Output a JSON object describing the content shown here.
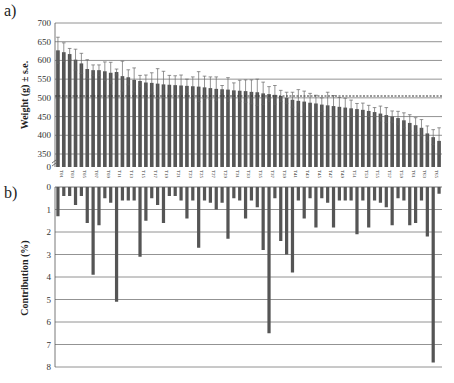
{
  "chart_data": [
    {
      "panel": "a)",
      "type": "bar",
      "title": "",
      "xlabel": "",
      "ylabel": "Weight (g) ± s.e.",
      "ylim": [
        350,
        700
      ],
      "yticks": [
        "700",
        "650",
        "600",
        "550",
        "500",
        "450",
        "400",
        "350",
        "0"
      ],
      "axis_break": true,
      "grid": true,
      "reference_line": {
        "value": 505,
        "style": "dashed"
      },
      "categories": [
        "T01",
        "T02",
        "T03",
        "T04",
        "T05",
        "T06",
        "T07",
        "T08",
        "T09",
        "T10",
        "T11",
        "T12",
        "T13",
        "T14",
        "T15",
        "T16",
        "T17",
        "T18",
        "T19",
        "T20",
        "T21",
        "T22",
        "T23",
        "T24",
        "T25",
        "T26",
        "T27",
        "T28",
        "T29",
        "T30",
        "T31",
        "T32",
        "T33",
        "T34",
        "T35",
        "T36",
        "T37",
        "T38",
        "T39",
        "T40",
        "T41",
        "T42",
        "T43",
        "T44",
        "T45",
        "T46",
        "T47",
        "T48",
        "T49",
        "T50",
        "T51",
        "T52",
        "T53",
        "T54",
        "T55",
        "T56",
        "T57",
        "T58",
        "T59",
        "T60",
        "T61",
        "T62",
        "T63",
        "T64",
        "T65",
        "T66"
      ],
      "xtick_labels": [
        "T01",
        "T03",
        "T05",
        "T07",
        "T09",
        "T11",
        "T13",
        "T15",
        "T17",
        "T19",
        "T21",
        "T23",
        "T25",
        "T27",
        "T29",
        "T31",
        "T33",
        "T35",
        "T37",
        "T39",
        "T41",
        "T43",
        "T45",
        "T47",
        "T49",
        "T51",
        "T53",
        "T55",
        "T57",
        "T59",
        "T61",
        "T63",
        "T65"
      ],
      "values": [
        627,
        622,
        617,
        602,
        592,
        577,
        574,
        574,
        571,
        567,
        569,
        558,
        555,
        548,
        545,
        541,
        540,
        538,
        536,
        535,
        534,
        533,
        532,
        531,
        530,
        528,
        526,
        524,
        523,
        522,
        520,
        519,
        518,
        516,
        515,
        512,
        510,
        508,
        505,
        500,
        495,
        492,
        490,
        487,
        485,
        482,
        480,
        478,
        476,
        474,
        472,
        470,
        468,
        465,
        462,
        458,
        454,
        450,
        446,
        440,
        433,
        427,
        420,
        405,
        395,
        385
      ],
      "errors": [
        35,
        25,
        15,
        28,
        27,
        25,
        14,
        14,
        25,
        28,
        8,
        40,
        20,
        32,
        15,
        20,
        27,
        40,
        35,
        25,
        25,
        28,
        18,
        25,
        40,
        30,
        30,
        32,
        10,
        32,
        20,
        28,
        30,
        32,
        35,
        30,
        20,
        25,
        15,
        15,
        20,
        30,
        28,
        25,
        22,
        18,
        35,
        28,
        25,
        25,
        22,
        15,
        18,
        15,
        12,
        20,
        20,
        15,
        18,
        20,
        22,
        20,
        22,
        20,
        20,
        35
      ]
    },
    {
      "panel": "b)",
      "type": "bar",
      "title": "",
      "xlabel": "",
      "ylabel": "Contribution (%)",
      "ylim": [
        0,
        8
      ],
      "inverted": true,
      "yticks": [
        "0",
        "1",
        "2",
        "3",
        "4",
        "5",
        "6",
        "7",
        "8"
      ],
      "grid": true,
      "categories": [
        "T01",
        "T02",
        "T03",
        "T04",
        "T05",
        "T06",
        "T07",
        "T08",
        "T09",
        "T10",
        "T11",
        "T12",
        "T13",
        "T14",
        "T15",
        "T16",
        "T17",
        "T18",
        "T19",
        "T20",
        "T21",
        "T22",
        "T23",
        "T24",
        "T25",
        "T26",
        "T27",
        "T28",
        "T29",
        "T30",
        "T31",
        "T32",
        "T33",
        "T34",
        "T35",
        "T36",
        "T37",
        "T38",
        "T39",
        "T40",
        "T41",
        "T42",
        "T43",
        "T44",
        "T45",
        "T46",
        "T47",
        "T48",
        "T49",
        "T50",
        "T51",
        "T52",
        "T53",
        "T54",
        "T55",
        "T56",
        "T57",
        "T58",
        "T59",
        "T60",
        "T61",
        "T62",
        "T63",
        "T64",
        "T65",
        "T66"
      ],
      "values": [
        1.3,
        0.4,
        0.4,
        0.8,
        0.4,
        1.6,
        3.9,
        1.7,
        0.5,
        0.7,
        5.1,
        0.6,
        0.6,
        0.6,
        3.1,
        1.5,
        0.5,
        0.8,
        1.6,
        0.4,
        0.4,
        0.6,
        1.4,
        0.6,
        2.7,
        0.6,
        0.7,
        1.0,
        0.7,
        2.3,
        0.5,
        0.6,
        1.4,
        0.6,
        0.9,
        2.8,
        6.5,
        0.5,
        2.4,
        3.0,
        3.8,
        0.6,
        1.4,
        0.5,
        1.8,
        0.5,
        0.7,
        1.8,
        0.6,
        0.6,
        0.6,
        2.1,
        0.6,
        1.8,
        0.6,
        0.7,
        0.9,
        1.7,
        0.5,
        0.6,
        1.7,
        1.6,
        0.6,
        2.2,
        7.8,
        0.3
      ]
    }
  ]
}
